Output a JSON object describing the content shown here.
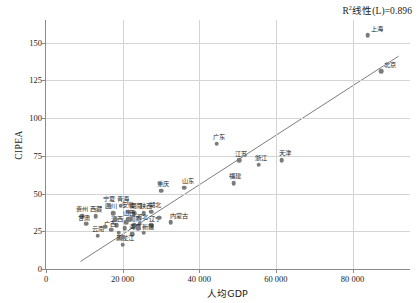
{
  "chart_data": {
    "type": "scatter",
    "title": "",
    "xlabel": "人均GDP",
    "ylabel": "CIPEA",
    "xlim": [
      0,
      95000
    ],
    "ylim": [
      0,
      165
    ],
    "xticks": [
      0,
      20000,
      40000,
      60000,
      80000
    ],
    "xticklabels": [
      "0",
      "20 000",
      "40 000",
      "60 000",
      "80 000"
    ],
    "yticks": [
      0,
      25,
      50,
      75,
      100,
      125,
      150
    ],
    "yticklabels": [
      "0",
      "25",
      "50",
      "75",
      "100",
      "125",
      "150"
    ],
    "grid": true,
    "legend": "none",
    "annotation": "R²线性(L)=0.896",
    "annotation_parts": {
      "r": "R",
      "sup": "2",
      "rest": "线性(L)=0.896"
    },
    "trendline": {
      "type": "linear",
      "r_squared": 0.896,
      "x_start": 9000,
      "y_start": 5,
      "x_end": 92000,
      "y_end": 141
    },
    "points": [
      {
        "label": "上海",
        "x": 84000,
        "y": 155,
        "label_dx": 9,
        "label_dy": -3
      },
      {
        "label": "北京",
        "x": 87500,
        "y": 131,
        "label_dx": 9,
        "label_dy": -3
      },
      {
        "label": "广东",
        "x": 44500,
        "y": 83,
        "label_dx": 2,
        "label_dy": -4
      },
      {
        "label": "江苏",
        "x": 50500,
        "y": 72,
        "label_dx": 2,
        "label_dy": -3
      },
      {
        "label": "浙江",
        "x": 55500,
        "y": 69,
        "label_dx": 2,
        "label_dy": -4
      },
      {
        "label": "天津",
        "x": 61500,
        "y": 72,
        "label_dx": 3,
        "label_dy": -4
      },
      {
        "label": "福建",
        "x": 49000,
        "y": 57,
        "label_dx": 1,
        "label_dy": -4
      },
      {
        "label": "山东",
        "x": 36000,
        "y": 54,
        "label_dx": 4,
        "label_dy": -4
      },
      {
        "label": "重庆",
        "x": 30000,
        "y": 52,
        "label_dx": 2,
        "label_dy": -4
      },
      {
        "label": "湖北",
        "x": 27500,
        "y": 38,
        "label_dx": 4,
        "label_dy": -4
      },
      {
        "label": "陕西",
        "x": 25500,
        "y": 37,
        "label_dx": 2,
        "label_dy": -4
      },
      {
        "label": "安徽",
        "x": 21500,
        "y": 38,
        "label_dx": 0,
        "label_dy": -4
      },
      {
        "label": "湖南",
        "x": 23000,
        "y": 37,
        "label_dx": 2,
        "label_dy": -4
      },
      {
        "label": "内蒙古",
        "x": 32500,
        "y": 31,
        "label_dx": 8,
        "label_dy": -3
      },
      {
        "label": "河北",
        "x": 24500,
        "y": 30,
        "label_dx": 2,
        "label_dy": -4
      },
      {
        "label": "辽宁",
        "x": 27500,
        "y": 29,
        "label_dx": 4,
        "label_dy": -3
      },
      {
        "label": "河南",
        "x": 23000,
        "y": 29,
        "label_dx": 1,
        "label_dy": -3
      },
      {
        "label": "山西",
        "x": 21500,
        "y": 33,
        "label_dx": 1,
        "label_dy": -3
      },
      {
        "label": "江西",
        "x": 18500,
        "y": 29,
        "label_dx": 0,
        "label_dy": -3
      },
      {
        "label": "广西",
        "x": 17000,
        "y": 26,
        "label_dx": -1,
        "label_dy": -3
      },
      {
        "label": "四川",
        "x": 17500,
        "y": 37,
        "label_dx": -2,
        "label_dy": -4
      },
      {
        "label": "宁夏",
        "x": 16500,
        "y": 42,
        "label_dx": 0,
        "label_dy": -4
      },
      {
        "label": "青海",
        "x": 19500,
        "y": 42,
        "label_dx": 2,
        "label_dy": -4
      },
      {
        "label": "西藏",
        "x": 13000,
        "y": 35,
        "label_dx": 0,
        "label_dy": -4
      },
      {
        "label": "贵州",
        "x": 9500,
        "y": 35,
        "label_dx": 0,
        "label_dy": -4
      },
      {
        "label": "甘肃",
        "x": 10500,
        "y": 30,
        "label_dx": -2,
        "label_dy": -3
      },
      {
        "label": "云南",
        "x": 13500,
        "y": 22,
        "label_dx": 0,
        "label_dy": -4
      },
      {
        "label": "新疆",
        "x": 25500,
        "y": 24,
        "label_dx": 4,
        "label_dy": -3
      },
      {
        "label": "海南",
        "x": 22500,
        "y": 23,
        "label_dx": 3,
        "label_dy": -4
      },
      {
        "label": "黑龙江",
        "x": 20000,
        "y": 16,
        "label_dx": 2,
        "label_dy": -4
      },
      {
        "label": "吉林",
        "x": 24000,
        "y": 27,
        "label_dx": 0,
        "label_dy": 0,
        "hide_label": true
      },
      {
        "label": "",
        "x": 19000,
        "y": 24,
        "hide_label": true
      },
      {
        "label": "",
        "x": 20500,
        "y": 27,
        "hide_label": true
      },
      {
        "label": "",
        "x": 21000,
        "y": 31,
        "hide_label": true
      },
      {
        "label": "",
        "x": 22000,
        "y": 33,
        "hide_label": true
      },
      {
        "label": "",
        "x": 15500,
        "y": 28,
        "hide_label": true
      },
      {
        "label": "",
        "x": 18000,
        "y": 33,
        "hide_label": true
      },
      {
        "label": "",
        "x": 29500,
        "y": 34,
        "hide_label": true
      },
      {
        "label": "",
        "x": 20000,
        "y": 21,
        "hide_label": true
      }
    ]
  }
}
